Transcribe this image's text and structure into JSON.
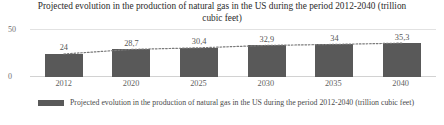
{
  "chart_data": {
    "type": "bar",
    "title": "Projected evolution in the production of natural gas in the US during the period 2012-2040 (trillion cubic feet)",
    "categories": [
      "2012",
      "2020",
      "2025",
      "2030",
      "2035",
      "2040"
    ],
    "values": [
      24,
      28.7,
      30.4,
      32.9,
      34,
      35.3
    ],
    "value_labels": [
      "24",
      "28,7",
      "30,4",
      "32,9",
      "34",
      "35,3"
    ],
    "series": [
      {
        "name": "Projected evolution in the production of natural gas in the US during the period 2012-2040 (trillion cubic feet)",
        "values": [
          24,
          28.7,
          30.4,
          32.9,
          34,
          35.3
        ]
      }
    ],
    "xlabel": "",
    "ylabel": "",
    "ylim": [
      0,
      50
    ],
    "y_ticks": [
      "0",
      "50"
    ],
    "grid": true,
    "legend_position": "bottom",
    "overlay": "dotted-trend-line",
    "colors": {
      "bar": "#595959",
      "gridline": "#e2e2e2",
      "trend_line": "#7a7a7a",
      "text": "#3a3a3a"
    }
  },
  "legend": {
    "label": "Projected evolution in the production of natural gas in the US during the period 2012-2040 (trillion cubic feet)"
  }
}
